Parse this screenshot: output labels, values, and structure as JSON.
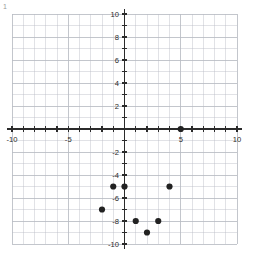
{
  "figure": {
    "corner_mark": "1",
    "background_color": "#ffffff",
    "grid_color": "#b9bcc4",
    "axis_color": "#2b2b2b",
    "point_color": "#222222",
    "label_color": "#2b2b2b"
  },
  "axes": {
    "x_tick_labels": [
      "-10",
      "-5",
      "5",
      "10"
    ],
    "y_tick_labels": [
      "10",
      "8",
      "6",
      "4",
      "2",
      "-2",
      "-4",
      "-6",
      "-8",
      "-10"
    ]
  },
  "chart_data": {
    "type": "scatter",
    "title": "",
    "xlabel": "",
    "ylabel": "",
    "xlim": [
      -10,
      10
    ],
    "ylim": [
      -10,
      10
    ],
    "grid": true,
    "legend": "none",
    "x_major_ticks": [
      -10,
      -5,
      0,
      5,
      10
    ],
    "y_major_ticks": [
      -10,
      -8,
      -6,
      -4,
      -2,
      0,
      2,
      4,
      6,
      8,
      10
    ],
    "x_minor_step": 1,
    "y_minor_step": 1,
    "series": [
      {
        "name": "points",
        "marker": "circle",
        "color": "#222222",
        "points": [
          {
            "x": 5,
            "y": 0
          },
          {
            "x": -1,
            "y": -5
          },
          {
            "x": 0,
            "y": -5
          },
          {
            "x": 4,
            "y": -5
          },
          {
            "x": -2,
            "y": -7
          },
          {
            "x": 1,
            "y": -8
          },
          {
            "x": 3,
            "y": -8
          },
          {
            "x": 2,
            "y": -9
          }
        ]
      }
    ]
  }
}
